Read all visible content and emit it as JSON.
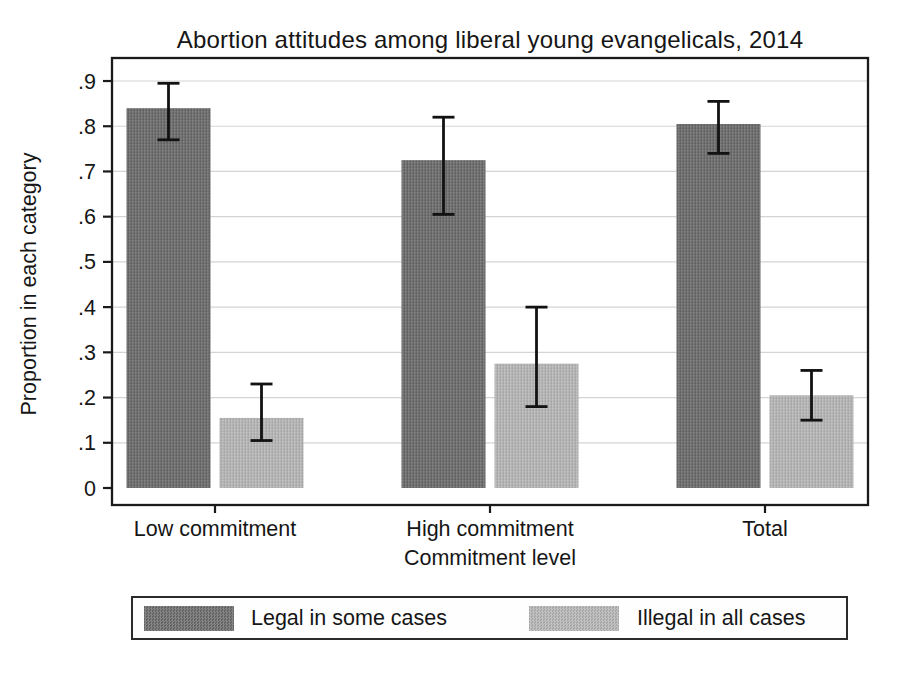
{
  "chart_data": {
    "type": "bar",
    "title": "Abortion attitudes among liberal young evangelicals, 2014",
    "xlabel": "Commitment level",
    "ylabel": "Proportion in each category",
    "categories": [
      "Low commitment",
      "High commitment",
      "Total"
    ],
    "series": [
      {
        "name": "Legal in some cases",
        "color": "#6b6b6b",
        "values": [
          0.84,
          0.725,
          0.805
        ],
        "ci_low": [
          0.77,
          0.605,
          0.74
        ],
        "ci_high": [
          0.895,
          0.82,
          0.855
        ]
      },
      {
        "name": "Illegal in all cases",
        "color": "#b5b5b5",
        "values": [
          0.155,
          0.275,
          0.205
        ],
        "ci_low": [
          0.105,
          0.18,
          0.15
        ],
        "ci_high": [
          0.23,
          0.4,
          0.26
        ]
      }
    ],
    "ylim": [
      0,
      0.94
    ],
    "ytick_values": [
      0,
      0.1,
      0.2,
      0.3,
      0.4,
      0.5,
      0.6,
      0.7,
      0.8,
      0.9
    ],
    "ytick_labels": [
      "0",
      ".1",
      ".2",
      ".3",
      ".4",
      ".5",
      ".6",
      ".7",
      ".8",
      ".9"
    ],
    "grid": true,
    "legend_position": "bottom",
    "error_bars": true,
    "colors": {
      "frame": "#1a1a1a",
      "gridline": "#d4d4d4",
      "error_bar": "#121212",
      "text": "#161616"
    }
  }
}
